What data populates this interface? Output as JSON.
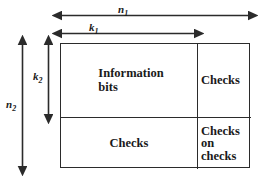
{
  "diagram": {
    "stroke_color": "#2b2b2b",
    "text_color": "#1a1a1a",
    "background": "#ffffff",
    "cells": {
      "information_bits": "Information\nbits",
      "information_bits_line1": "Information",
      "information_bits_line2": "bits",
      "checks_row": "Checks",
      "checks_column": "Checks",
      "checks_on_checks_line1": "Checks",
      "checks_on_checks_line2": "on",
      "checks_on_checks_line3": "checks"
    },
    "dimensions": {
      "n1": {
        "symbol": "n",
        "subscript": "1",
        "orientation": "horizontal",
        "spans": "full-width",
        "from_px": 60,
        "to_px": 250
      },
      "k1": {
        "symbol": "k",
        "subscript": "1",
        "orientation": "horizontal",
        "spans": "information-columns",
        "from_px": 60,
        "to_px": 196
      },
      "n2": {
        "symbol": "n",
        "subscript": "2",
        "orientation": "vertical",
        "spans": "full-height",
        "from_px": 43,
        "to_px": 168
      },
      "k2": {
        "symbol": "k",
        "subscript": "2",
        "orientation": "vertical",
        "spans": "information-rows",
        "from_px": 43,
        "to_px": 116
      }
    },
    "geometry": {
      "box_left": 60,
      "box_top": 43,
      "box_width": 190,
      "box_height": 125,
      "vertical_divider_x": 196,
      "horizontal_divider_y": 116
    }
  }
}
